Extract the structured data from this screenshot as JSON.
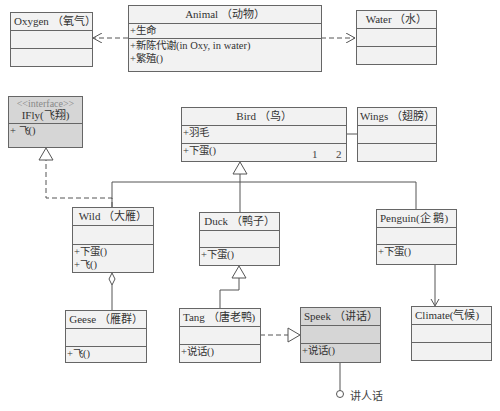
{
  "classes": {
    "oxygen": {
      "name": "Oxygen （氧气）",
      "attributes": [],
      "methods": []
    },
    "animal": {
      "name": "Animal （动物）",
      "attributes": [
        "+生命"
      ],
      "methods": [
        "+新陈代谢(in Oxy, in water)",
        "+繁殖()"
      ]
    },
    "water": {
      "name": "Water （水）",
      "attributes": [],
      "methods": []
    },
    "ifly": {
      "stereotype": "<<interface>>",
      "name": "IFly(飞翔)",
      "methods": [
        "+ 飞()"
      ]
    },
    "bird": {
      "name": "Bird （鸟）",
      "attributes": [
        "+羽毛"
      ],
      "methods": [
        "+下蛋()"
      ]
    },
    "wings": {
      "name": "Wings （翅膀）",
      "attributes": [],
      "methods": []
    },
    "wild": {
      "name": "Wild （大雁）",
      "attributes": [],
      "methods": [
        "+下蛋()",
        "+飞()"
      ]
    },
    "duck": {
      "name": "Duck （鸭子）",
      "attributes": [],
      "methods": [
        "+下蛋()"
      ]
    },
    "penguin": {
      "name": "Penguin(企 鹅)",
      "attributes": [],
      "methods": [
        "+下蛋()"
      ]
    },
    "geese": {
      "name": "Geese （雁群）",
      "attributes": [],
      "methods": [
        "+飞()"
      ]
    },
    "tang": {
      "name": "Tang （唐老鸭)",
      "attributes": [],
      "methods": [
        "+说话()"
      ]
    },
    "speek": {
      "name": "Speek （讲话）",
      "attributes": [],
      "methods": [
        "+说话()"
      ]
    },
    "climate": {
      "name": "Climate(气候)",
      "attributes": [],
      "methods": []
    }
  },
  "multiplicity": {
    "bird_end": "1",
    "wings_end": "2"
  },
  "lollipop_label": "讲人话",
  "colors": {
    "box_fill": "#f2f2f2",
    "interface_fill": "#d6d6d6",
    "line": "#555555"
  }
}
